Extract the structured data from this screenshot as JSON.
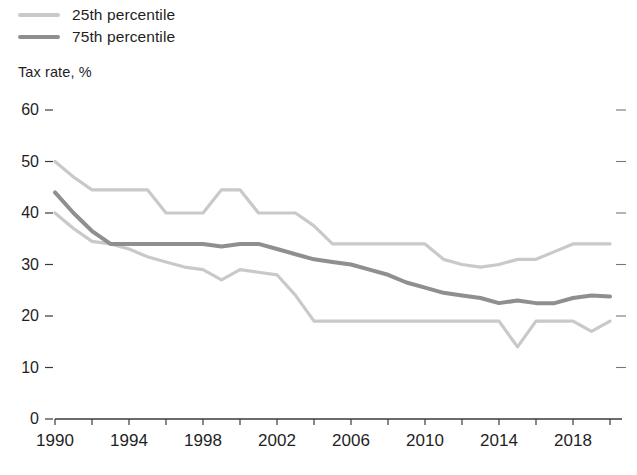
{
  "legend": {
    "position": "top-left",
    "items": [
      {
        "label": "25th percentile",
        "color": "#c9c9c9",
        "icon": "line-swatch"
      },
      {
        "label": "75th percentile",
        "color": "#8f8f8f",
        "icon": "line-swatch"
      }
    ]
  },
  "axis_title": "Tax rate, %",
  "footnote": "",
  "colors": {
    "light_line": "#c9c9c9",
    "dark_line": "#8f8f8f",
    "axis": "#3a3a3a",
    "text": "#1f1f1f"
  },
  "chart_data": {
    "type": "line",
    "title": "",
    "subtitle": "",
    "xlabel": "",
    "ylabel": "Tax rate, %",
    "ylim": [
      0,
      60
    ],
    "xlim": [
      1990,
      2020
    ],
    "yticks": [
      0,
      10,
      20,
      30,
      40,
      50,
      60
    ],
    "xticks": [
      1990,
      1992,
      1994,
      1996,
      1998,
      2000,
      2002,
      2004,
      2006,
      2008,
      2010,
      2012,
      2014,
      2016,
      2018,
      2020
    ],
    "xtick_labels_shown": [
      1990,
      1994,
      1998,
      2002,
      2006,
      2010,
      2014,
      2018
    ],
    "grid": false,
    "legend_position": "top-left",
    "x": [
      1990,
      1991,
      1992,
      1993,
      1994,
      1995,
      1996,
      1997,
      1998,
      1999,
      2000,
      2001,
      2002,
      2003,
      2004,
      2005,
      2006,
      2007,
      2008,
      2009,
      2010,
      2011,
      2012,
      2013,
      2014,
      2015,
      2016,
      2017,
      2018,
      2019,
      2020
    ],
    "series": [
      {
        "name": "75th percentile",
        "color": "#c9c9c9",
        "values": [
          50.0,
          47.0,
          44.5,
          44.5,
          44.5,
          44.5,
          40.0,
          40.0,
          40.0,
          44.5,
          44.5,
          40.0,
          40.0,
          40.0,
          37.5,
          34.0,
          34.0,
          34.0,
          34.0,
          34.0,
          34.0,
          31.0,
          30.0,
          29.5,
          30.0,
          31.0,
          31.0,
          32.5,
          34.0,
          34.0,
          34.0
        ]
      },
      {
        "name": "Median",
        "color": "#8f8f8f",
        "values": [
          44.0,
          40.0,
          36.5,
          34.0,
          34.0,
          34.0,
          34.0,
          34.0,
          34.0,
          33.5,
          34.0,
          34.0,
          33.0,
          32.0,
          31.0,
          30.5,
          30.0,
          29.0,
          28.0,
          26.5,
          25.5,
          24.5,
          24.0,
          23.5,
          22.5,
          23.0,
          22.5,
          22.5,
          23.5,
          24.0,
          23.8
        ]
      },
      {
        "name": "25th percentile",
        "color": "#c9c9c9",
        "values": [
          40.0,
          37.0,
          34.5,
          34.0,
          33.0,
          31.5,
          30.5,
          29.5,
          29.0,
          27.0,
          29.0,
          28.5,
          28.0,
          24.0,
          19.0,
          19.0,
          19.0,
          19.0,
          19.0,
          19.0,
          19.0,
          19.0,
          19.0,
          19.0,
          19.0,
          14.0,
          19.0,
          19.0,
          19.0,
          17.0,
          19.0
        ]
      }
    ]
  }
}
